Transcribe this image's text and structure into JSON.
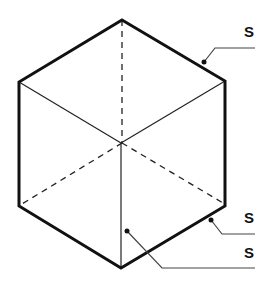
{
  "diagram": {
    "title": "",
    "shape": "isometric-cube",
    "colors": {
      "stroke": "#111111",
      "leader": "#444444",
      "background": "#ffffff"
    },
    "labels": [
      {
        "id": "label-top-right",
        "text": "S"
      },
      {
        "id": "label-bottom-right",
        "text": "S"
      },
      {
        "id": "label-bottom-face",
        "text": "S"
      }
    ]
  }
}
